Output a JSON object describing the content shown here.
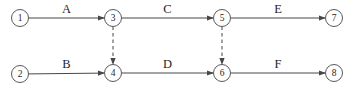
{
  "diagram": {
    "background_color": "#ffffff",
    "line_color": "#474747",
    "circle_stroke_color": "#5a5a5a",
    "text_color": "#1f1f1f",
    "node_radius": 8.5,
    "node_font_size": 9.5,
    "label_font_size": 12.5,
    "nodes": [
      {
        "id": "1",
        "x": 20,
        "y": 18
      },
      {
        "id": "2",
        "x": 20,
        "y": 74
      },
      {
        "id": "3",
        "x": 113,
        "y": 18
      },
      {
        "id": "4",
        "x": 113,
        "y": 73
      },
      {
        "id": "5",
        "x": 222,
        "y": 18
      },
      {
        "id": "6",
        "x": 222,
        "y": 73
      },
      {
        "id": "7",
        "x": 334,
        "y": 18
      },
      {
        "id": "8",
        "x": 334,
        "y": 73
      }
    ],
    "edges": [
      {
        "from": "1",
        "to": "3",
        "label": "A",
        "style": "solid"
      },
      {
        "from": "3",
        "to": "5",
        "label": "C",
        "style": "solid"
      },
      {
        "from": "5",
        "to": "7",
        "label": "E",
        "style": "solid"
      },
      {
        "from": "2",
        "to": "4",
        "label": "B",
        "style": "solid"
      },
      {
        "from": "4",
        "to": "6",
        "label": "D",
        "style": "solid"
      },
      {
        "from": "6",
        "to": "8",
        "label": "F",
        "style": "solid"
      },
      {
        "from": "3",
        "to": "4",
        "label": "",
        "style": "dashed"
      },
      {
        "from": "5",
        "to": "6",
        "label": "",
        "style": "dashed"
      }
    ]
  }
}
